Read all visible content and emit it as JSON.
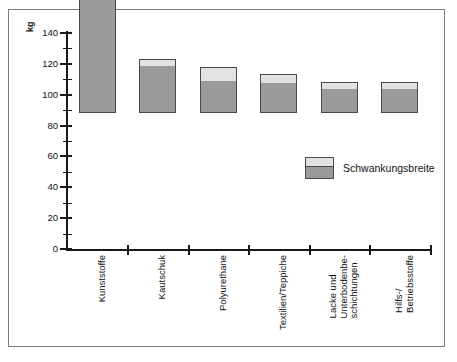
{
  "chart_data": {
    "type": "bar",
    "title": "",
    "subtitle": "",
    "xlabel": "",
    "ylabel": "kg",
    "unit_label": "kg",
    "ylim": [
      0,
      140
    ],
    "ytick_step": 20,
    "yminor_step": 10,
    "grid": false,
    "stacked": true,
    "legend_position": "inside-right",
    "categories": [
      "Kunststoffe",
      "Kautschuk",
      "Polyurethane",
      "Textilien/Teppiche",
      "Lacke und Unterbodenbe-schichtungen",
      "Hilfs-/ Betriebsstoffe"
    ],
    "category_label_lines": [
      [
        "Kunststoffe"
      ],
      [
        "Kautschuk"
      ],
      [
        "Polyurethane"
      ],
      [
        "Textilien/Teppiche"
      ],
      [
        "Lacke und",
        "Unterbodenbe-",
        "schichtungen"
      ],
      [
        "Hilfs-/",
        "Betriebsstoffe"
      ]
    ],
    "ytick_labels": [
      "0",
      "20",
      "40",
      "60",
      "80",
      "100",
      "120",
      "140"
    ],
    "ytick_values": [
      0,
      20,
      40,
      60,
      80,
      100,
      120,
      140
    ],
    "yminor_values": [
      10,
      30,
      50,
      70,
      90,
      110,
      130
    ],
    "series": [
      {
        "name": "Basiswert",
        "values": [
          100,
          30,
          20,
          19,
          15,
          15
        ],
        "color": "#9a9a9a"
      },
      {
        "name": "Schwankungsbreite",
        "values": [
          25,
          5,
          10,
          6,
          5,
          5
        ],
        "color": "#e2e2e2"
      }
    ],
    "totals": [
      125,
      35,
      30,
      25,
      20,
      20
    ],
    "legend": [
      {
        "label": "Schwankungsbreite",
        "color_top": "#e2e2e2",
        "color_bottom": "#9a9a9a"
      }
    ],
    "colors": {
      "base_fill": "#9a9a9a",
      "variation_fill": "#e2e2e2",
      "bar_outline": "#4a4a4a",
      "axis": "#1a1a1a",
      "frame": "#7c7c7c",
      "background": "#ffffff",
      "text": "#111111"
    }
  }
}
